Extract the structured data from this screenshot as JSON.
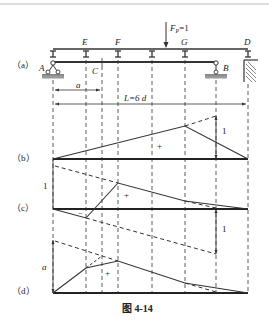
{
  "figure": {
    "caption": "图 4-14",
    "panels": [
      {
        "id": "a",
        "label": "（a）"
      },
      {
        "id": "b",
        "label": "（b）"
      },
      {
        "id": "c",
        "label": "（c）"
      },
      {
        "id": "d",
        "label": "（d）"
      }
    ],
    "points": {
      "A": "A",
      "B": "B",
      "C": "C",
      "D": "D",
      "E": "E",
      "F": "F",
      "G": "G"
    },
    "load": "FP=1",
    "load_main": "F",
    "load_sub": "P",
    "load_eq": "=1",
    "dimensions": {
      "a": "a",
      "L": "L=6 d"
    },
    "annotations": {
      "b_value": "1",
      "b_sign": "+",
      "c_left_value": "1",
      "c_right_value": "1",
      "c_pos_sign": "+",
      "c_neg_sign": "−",
      "d_value": "a",
      "d_sign": "+"
    }
  }
}
